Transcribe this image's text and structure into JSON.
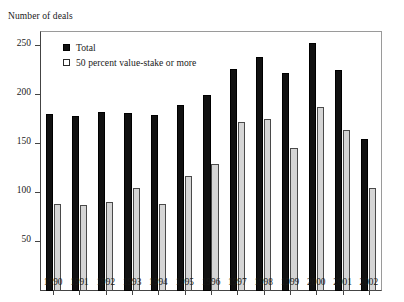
{
  "chart_data": {
    "type": "bar",
    "title": "",
    "ylabel": "Number of deals",
    "xlabel": "",
    "ylim": [
      0,
      265
    ],
    "yticks": [
      50,
      100,
      150,
      200,
      250
    ],
    "grid": false,
    "legend_position": "top-left",
    "categories": [
      "1990",
      "1991",
      "1992",
      "1993",
      "1994",
      "1995",
      "1996",
      "1997",
      "1998",
      "1999",
      "2000",
      "2001",
      "2002"
    ],
    "series": [
      {
        "name": "Total",
        "color": "#111111",
        "values": [
          180,
          178,
          182,
          181,
          179,
          190,
          200,
          226,
          239,
          222,
          253,
          225,
          155
        ]
      },
      {
        "name": "50 percent value-stake or more",
        "color": "#d5d5d5",
        "values": [
          89,
          88,
          91,
          105,
          89,
          117,
          129,
          172,
          175,
          146,
          188,
          164,
          105
        ]
      }
    ]
  },
  "legend": {
    "items": [
      {
        "label": "Total",
        "swatch": "filled-square-icon"
      },
      {
        "label": "50 percent value-stake or more",
        "swatch": "hollow-square-icon"
      }
    ]
  }
}
